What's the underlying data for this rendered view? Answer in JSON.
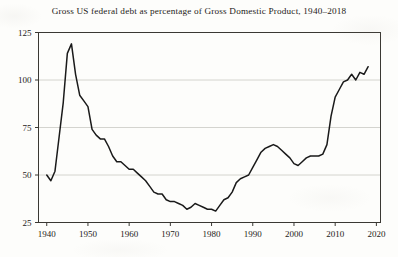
{
  "chart_data": {
    "type": "line",
    "title": "Gross US federal debt as percentage of Gross Domestic Product, 1940–2018",
    "xlabel": "",
    "ylabel": "",
    "xlim": [
      1938,
      2021
    ],
    "ylim": [
      25,
      125
    ],
    "xticks": [
      1940,
      1950,
      1960,
      1970,
      1980,
      1990,
      2000,
      2010,
      2020
    ],
    "yticks": [
      25,
      50,
      75,
      100,
      125
    ],
    "xtick_labels": [
      "1940",
      "1950",
      "1960",
      "1970",
      "1980",
      "1990",
      "2000",
      "2010",
      "2020"
    ],
    "ytick_labels": [
      "25",
      "50",
      "75",
      "100",
      "125"
    ],
    "grid": "horizontal",
    "legend": "none",
    "line_color": "#1a1a1a",
    "x": [
      1940,
      1941,
      1942,
      1943,
      1944,
      1945,
      1946,
      1947,
      1948,
      1949,
      1950,
      1951,
      1952,
      1953,
      1954,
      1955,
      1956,
      1957,
      1958,
      1959,
      1960,
      1961,
      1962,
      1963,
      1964,
      1965,
      1966,
      1967,
      1968,
      1969,
      1970,
      1971,
      1972,
      1973,
      1974,
      1975,
      1976,
      1977,
      1978,
      1979,
      1980,
      1981,
      1982,
      1983,
      1984,
      1985,
      1986,
      1987,
      1988,
      1989,
      1990,
      1991,
      1992,
      1993,
      1994,
      1995,
      1996,
      1997,
      1998,
      1999,
      2000,
      2001,
      2002,
      2003,
      2004,
      2005,
      2006,
      2007,
      2008,
      2009,
      2010,
      2011,
      2012,
      2013,
      2014,
      2015,
      2016,
      2017,
      2018
    ],
    "values": [
      50.0,
      47.0,
      52.0,
      70.0,
      88.0,
      114.0,
      119.0,
      103.0,
      92.0,
      89.0,
      86.0,
      74.0,
      71.0,
      69.0,
      69.0,
      65.0,
      60.0,
      57.0,
      57.0,
      55.0,
      53.0,
      53.0,
      51.0,
      49.0,
      47.0,
      44.0,
      41.0,
      40.0,
      40.0,
      37.0,
      36.0,
      36.0,
      35.0,
      34.0,
      32.0,
      33.0,
      35.0,
      34.0,
      33.0,
      32.0,
      32.0,
      31.0,
      34.0,
      37.0,
      38.0,
      41.0,
      46.0,
      48.0,
      49.0,
      50.0,
      54.0,
      58.0,
      62.0,
      64.0,
      65.0,
      66.0,
      65.0,
      63.0,
      61.0,
      59.0,
      56.0,
      55.0,
      57.0,
      59.0,
      60.0,
      60.0,
      60.0,
      61.0,
      66.0,
      81.0,
      91.0,
      95.0,
      99.0,
      100.0,
      103.0,
      100.0,
      104.0,
      103.0,
      107.0
    ]
  }
}
